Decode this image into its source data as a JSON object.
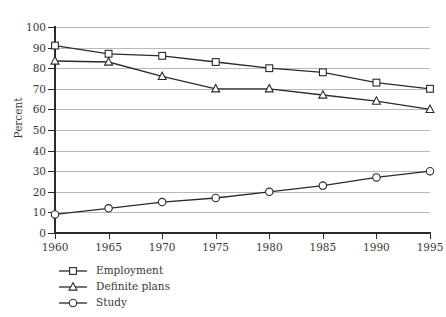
{
  "chart_data": {
    "type": "line",
    "title": "",
    "xlabel": "",
    "ylabel": "Percent",
    "x": [
      1960,
      1965,
      1970,
      1975,
      1980,
      1985,
      1990,
      1995
    ],
    "xticklabels": [
      "1960",
      "1965",
      "1970",
      "1975",
      "1980",
      "1985",
      "1990",
      "1995"
    ],
    "yticklabels": [
      "0",
      "10",
      "20",
      "30",
      "40",
      "50",
      "60",
      "70",
      "80",
      "90",
      "100"
    ],
    "yticks": [
      0,
      10,
      20,
      30,
      40,
      50,
      60,
      70,
      80,
      90,
      100
    ],
    "xlim": [
      1958,
      1996
    ],
    "ylim": [
      0,
      100
    ],
    "grid": "horizontal",
    "legend_position": "below-left",
    "series": [
      {
        "name": "Employment",
        "marker": "square",
        "values": [
          91,
          87,
          86,
          83,
          80,
          78,
          73,
          70
        ]
      },
      {
        "name": "Definite plans",
        "marker": "triangle",
        "values": [
          83.5,
          83,
          76,
          70,
          70,
          67,
          64,
          60
        ]
      },
      {
        "name": "Study",
        "marker": "circle",
        "values": [
          9,
          12,
          15,
          17,
          20,
          23,
          27,
          30
        ]
      }
    ],
    "colors": {
      "line": "#2b2b2b",
      "grid": "#b9b9b9",
      "axis": "#2b2b2b",
      "text": "#3a3a3a",
      "background": "#ffffff"
    }
  },
  "legend": {
    "items": [
      {
        "label": "Employment",
        "marker": "square-marker-icon"
      },
      {
        "label": "Definite plans",
        "marker": "triangle-marker-icon"
      },
      {
        "label": "Study",
        "marker": "circle-marker-icon"
      }
    ]
  }
}
